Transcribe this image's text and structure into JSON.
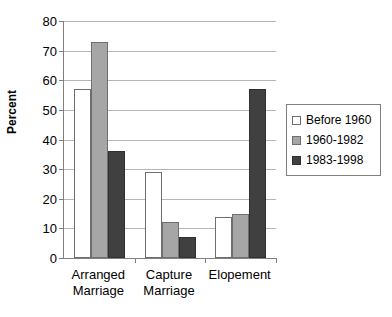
{
  "chart_data": {
    "type": "bar",
    "title": "",
    "xlabel": "",
    "ylabel": "Percent",
    "ylim": [
      0,
      80
    ],
    "ytick_step": 10,
    "yticks": [
      80,
      70,
      60,
      50,
      40,
      30,
      20,
      10,
      0
    ],
    "grid": true,
    "legend_position": "right",
    "categories": [
      "Arranged\nMarriage",
      "Capture\nMarriage",
      "Elopement"
    ],
    "series": [
      {
        "name": "Before 1960",
        "color": "#ffffff",
        "values": [
          57,
          29,
          14
        ]
      },
      {
        "name": "1960-1982",
        "color": "#a6a6a6",
        "values": [
          73,
          12,
          15
        ]
      },
      {
        "name": "1983-1998",
        "color": "#404040",
        "values": [
          36,
          7,
          57
        ]
      }
    ]
  },
  "axis": {
    "ylabel": "Percent",
    "ytick_labels": [
      "80",
      "70",
      "60",
      "50",
      "40",
      "30",
      "20",
      "10",
      "0"
    ],
    "xtick_labels": [
      "Arranged\nMarriage",
      "Capture\nMarriage",
      "Elopement"
    ]
  },
  "legend": {
    "items": [
      {
        "label": "Before 1960",
        "swatch": "series-0-swatch"
      },
      {
        "label": "1960-1982",
        "swatch": "series-1-swatch"
      },
      {
        "label": "1983-1998",
        "swatch": "series-2-swatch"
      }
    ]
  }
}
